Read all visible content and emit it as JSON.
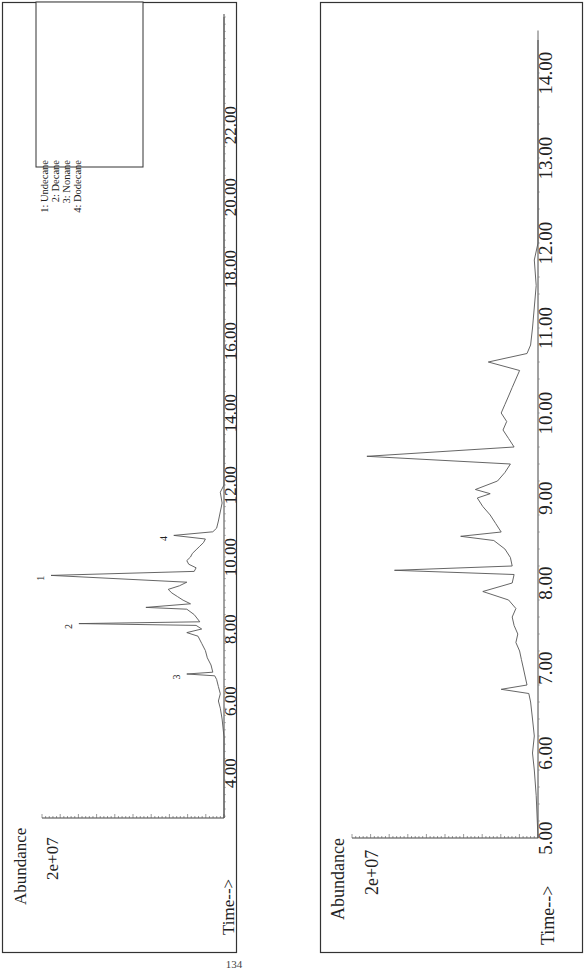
{
  "page": {
    "page_number": "134"
  },
  "legend": {
    "items": [
      {
        "id": "1",
        "label": "1: Undecane"
      },
      {
        "id": "2",
        "label": "2: Decane"
      },
      {
        "id": "3",
        "label": "3: Nonane"
      },
      {
        "id": "4",
        "label": "4: Dodecane"
      }
    ]
  },
  "carbon_scales": {
    "upper": {
      "labels": [
        "C6",
        "C7",
        "C8",
        "C9",
        "C10",
        "C15",
        "C20",
        "C25"
      ]
    },
    "lower": {
      "labels": [
        "C8",
        "C9",
        "C10",
        "C11",
        "C12",
        "C13",
        "C14",
        "C15",
        "C16"
      ]
    }
  },
  "chart_data": [
    {
      "type": "line",
      "title": "Total ion chromatogram (full run)",
      "xlabel": "Time-->",
      "ylabel": "Abundance",
      "y_tick_label": "2e+07",
      "xlim": [
        2.75,
        25.1
      ],
      "x_ticks": [
        "4.00",
        "6.00",
        "8.00",
        "10.00",
        "12.00",
        "14.00",
        "16.00",
        "18.00",
        "20.00",
        "22.00"
      ],
      "grid": false,
      "legend_position": "upper-right",
      "peak_labels": [
        {
          "label": "1",
          "compound": "Undecane",
          "time": 9.49,
          "rel_abundance": 0.93
        },
        {
          "label": "2",
          "compound": "Decane",
          "time": 8.15,
          "rel_abundance": 0.78
        },
        {
          "label": "3",
          "compound": "Nonane",
          "time": 6.75,
          "rel_abundance": 0.2
        },
        {
          "label": "4",
          "compound": "Dodecane",
          "time": 10.6,
          "rel_abundance": 0.27
        }
      ],
      "series": [
        {
          "name": "TIC",
          "x": [
            2.75,
            5.0,
            5.5,
            5.8,
            6.0,
            6.2,
            6.4,
            6.6,
            6.7,
            6.75,
            6.8,
            7.0,
            7.2,
            7.4,
            7.6,
            7.8,
            7.9,
            8.0,
            8.1,
            8.15,
            8.2,
            8.4,
            8.55,
            8.6,
            8.7,
            8.8,
            8.9,
            9.0,
            9.1,
            9.2,
            9.3,
            9.49,
            9.6,
            9.7,
            9.8,
            9.9,
            10.0,
            10.1,
            10.2,
            10.3,
            10.4,
            10.5,
            10.6,
            10.7,
            10.8,
            11.0,
            11.5,
            11.8,
            12.0,
            14.0,
            20.0,
            25.0
          ],
          "y": [
            0.0,
            0.0,
            0.01,
            0.02,
            0.03,
            0.02,
            0.03,
            0.04,
            0.05,
            0.2,
            0.06,
            0.07,
            0.09,
            0.1,
            0.12,
            0.14,
            0.2,
            0.12,
            0.15,
            0.78,
            0.13,
            0.16,
            0.2,
            0.42,
            0.18,
            0.22,
            0.25,
            0.28,
            0.3,
            0.24,
            0.2,
            0.93,
            0.16,
            0.15,
            0.19,
            0.2,
            0.18,
            0.17,
            0.15,
            0.13,
            0.11,
            0.1,
            0.27,
            0.06,
            0.04,
            0.03,
            0.01,
            0.02,
            0.0,
            0.0,
            0.0,
            0.0
          ]
        }
      ]
    },
    {
      "type": "line",
      "title": "Total ion chromatogram (expanded 5-14.5 min)",
      "xlabel": "Time-->",
      "ylabel": "Abundance",
      "y_tick_label": "2e+07",
      "xlim": [
        5.0,
        14.5
      ],
      "x_ticks": [
        "5.00",
        "6.00",
        "7.00",
        "8.00",
        "9.00",
        "10.00",
        "11.00",
        "12.00",
        "13.00",
        "14.00"
      ],
      "grid": false,
      "series": [
        {
          "name": "TIC",
          "x": [
            5.0,
            5.5,
            5.8,
            6.0,
            6.2,
            6.4,
            6.6,
            6.7,
            6.75,
            6.8,
            7.0,
            7.1,
            7.2,
            7.3,
            7.4,
            7.5,
            7.6,
            7.7,
            7.8,
            7.9,
            8.0,
            8.1,
            8.15,
            8.2,
            8.3,
            8.4,
            8.5,
            8.55,
            8.6,
            8.7,
            8.8,
            8.9,
            9.0,
            9.05,
            9.1,
            9.2,
            9.3,
            9.4,
            9.49,
            9.6,
            9.7,
            9.8,
            9.9,
            10.0,
            10.1,
            10.2,
            10.3,
            10.4,
            10.5,
            10.6,
            10.7,
            10.8,
            11.0,
            11.5,
            11.8,
            12.0,
            14.5
          ],
          "y": [
            0.0,
            0.01,
            0.02,
            0.03,
            0.02,
            0.03,
            0.04,
            0.05,
            0.2,
            0.06,
            0.08,
            0.09,
            0.1,
            0.12,
            0.11,
            0.13,
            0.14,
            0.12,
            0.16,
            0.3,
            0.14,
            0.13,
            0.78,
            0.14,
            0.15,
            0.18,
            0.24,
            0.42,
            0.2,
            0.23,
            0.26,
            0.3,
            0.33,
            0.26,
            0.34,
            0.22,
            0.18,
            0.15,
            0.93,
            0.13,
            0.16,
            0.19,
            0.17,
            0.2,
            0.18,
            0.16,
            0.14,
            0.12,
            0.1,
            0.27,
            0.06,
            0.04,
            0.03,
            0.01,
            0.02,
            0.0,
            0.0
          ]
        }
      ]
    }
  ]
}
